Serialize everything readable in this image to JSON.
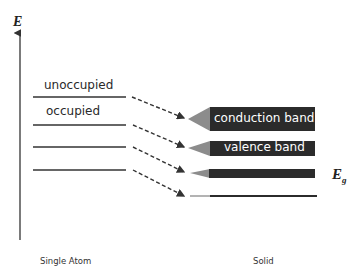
{
  "axis": {
    "label": "E"
  },
  "single_atom": {
    "caption": "Single Atom",
    "levels": [
      {
        "label": "unoccupied"
      },
      {
        "label": "occupied"
      },
      {
        "label": ""
      },
      {
        "label": ""
      }
    ]
  },
  "solid": {
    "caption": "Solid",
    "bands": [
      {
        "label": "conduction band"
      },
      {
        "label": "valence band"
      },
      {
        "label": ""
      },
      {
        "label": ""
      }
    ],
    "gap_label": "E",
    "gap_subscript": "g"
  },
  "colors": {
    "band_fill": "#2b2b2b",
    "band_tip": "#8c8c8c",
    "line": "#333333"
  }
}
